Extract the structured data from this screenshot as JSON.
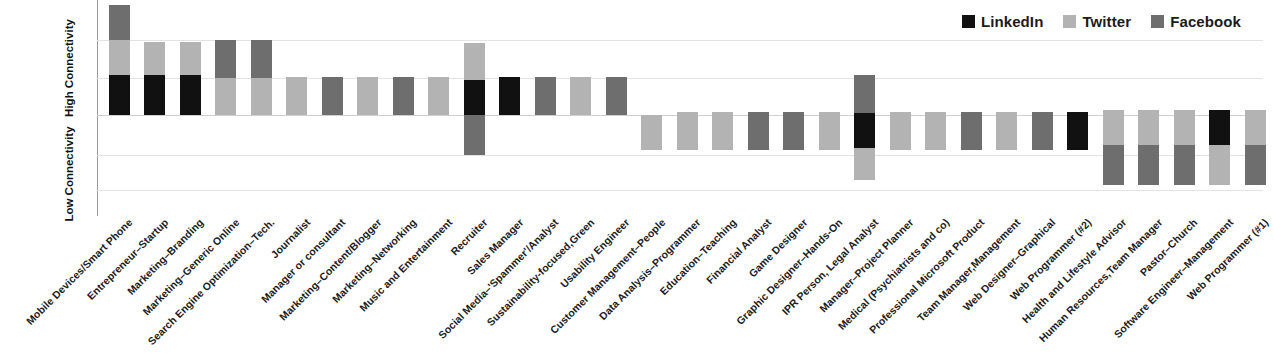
{
  "legend": {
    "position": "top-right",
    "items": [
      {
        "label": "LinkedIn",
        "color": "#111111"
      },
      {
        "label": "Twitter",
        "color": "#b3b3b3"
      },
      {
        "label": "Facebook",
        "color": "#6e6e6e"
      }
    ]
  },
  "yaxis": {
    "high_label": "High Connectivity",
    "low_label": "Low Connectivity"
  },
  "chart_data": {
    "type": "bar",
    "title": "",
    "subtitle": "",
    "xlabel": "",
    "ylabel": "Connectivity",
    "stacked": true,
    "orientation": "vertical",
    "grid": true,
    "legend_position": "top-right",
    "baseline": 0,
    "ylim": [
      -3,
      3
    ],
    "ytick_labels": [
      "High Connectivity",
      "Low Connectivity"
    ],
    "series_colors": {
      "LinkedIn": "#111111",
      "Twitter": "#b3b3b3",
      "Facebook": "#6e6e6e"
    },
    "categories": [
      "Mobile Devices/Smart Phone",
      "Entrepreneur–Startup",
      "Marketing–Branding",
      "Marketing–Generic Online",
      "Search Engine Optimization–Tech.",
      "Journalist",
      "Manager or consultant",
      "Marketing–Content/Blogger",
      "Marketing–Networking",
      "Music and Entertainment",
      "Recruiter",
      "Sales Manager",
      "Social Media–'Spammer'/Analyst",
      "Sustainability-focused,Green",
      "Usability Engineer",
      "Customer Management–People",
      "Data Analysis–Programmer",
      "Education–Teaching",
      "Financial Analyst",
      "Game Designer",
      "Graphic Designer–Hands-On",
      "IPR Person, Legal Analyst",
      "Manager–Project Planner",
      "Medical (Psychiatrists and co)",
      "Professional Microsoft Product",
      "Team Manager,Management",
      "Web Designer–Graphical",
      "Web Programmer (#2)",
      "Health and Lifestyle Advisor",
      "Human Resources,Team Manager",
      "Pastor–Church",
      "Software Engineer–Management",
      "Web Programmer (#1)"
    ],
    "series": [
      {
        "name": "LinkedIn",
        "values": [
          1.0,
          1.0,
          1.0,
          0,
          0,
          0,
          0,
          0,
          0,
          0,
          1.0,
          1.0,
          0,
          0,
          0,
          0,
          0,
          0,
          0,
          0,
          0,
          1.0,
          0,
          0,
          0,
          0,
          0,
          1.0,
          0,
          0,
          0,
          1.0,
          0
        ]
      },
      {
        "name": "Twitter",
        "values": [
          1.0,
          1.0,
          1.0,
          1.0,
          1.0,
          1.0,
          0,
          1.0,
          0,
          1.0,
          1.0,
          0,
          0,
          1.0,
          1.0,
          1.0,
          1.0,
          1.0,
          0,
          0,
          1.0,
          -1.0,
          1.0,
          1.0,
          0,
          1.0,
          0,
          1.0,
          1.0,
          1.0,
          1.0,
          1.0,
          1.0
        ]
      },
      {
        "name": "Facebook",
        "values": [
          1.0,
          0,
          0,
          1.0,
          1.0,
          0,
          1.0,
          0,
          1.0,
          0,
          -1.0,
          0,
          1.0,
          0,
          0,
          0,
          0,
          0,
          1.0,
          1.0,
          0,
          1.0,
          0,
          0,
          1.0,
          0,
          1.0,
          0,
          -1.0,
          -1.0,
          -1.0,
          0,
          -1.0
        ]
      }
    ],
    "bars": [
      {
        "category": "Mobile Devices/Smart Phone",
        "segments": [
          {
            "series": "Facebook",
            "top": 5,
            "bottom": 40
          },
          {
            "series": "Twitter",
            "top": 40,
            "bottom": 75
          },
          {
            "series": "LinkedIn",
            "top": 75,
            "bottom": 115
          }
        ]
      },
      {
        "category": "Entrepreneur–Startup",
        "segments": [
          {
            "series": "Twitter",
            "top": 42,
            "bottom": 75
          },
          {
            "series": "LinkedIn",
            "top": 75,
            "bottom": 115
          }
        ]
      },
      {
        "category": "Marketing–Branding",
        "segments": [
          {
            "series": "Twitter",
            "top": 42,
            "bottom": 75
          },
          {
            "series": "LinkedIn",
            "top": 75,
            "bottom": 115
          }
        ]
      },
      {
        "category": "Marketing–Generic Online",
        "segments": [
          {
            "series": "Facebook",
            "top": 40,
            "bottom": 78
          },
          {
            "series": "Twitter",
            "top": 78,
            "bottom": 115
          }
        ]
      },
      {
        "category": "Search Engine Optimization–Tech.",
        "segments": [
          {
            "series": "Facebook",
            "top": 40,
            "bottom": 78
          },
          {
            "series": "Twitter",
            "top": 78,
            "bottom": 115
          }
        ]
      },
      {
        "category": "Journalist",
        "segments": [
          {
            "series": "Twitter",
            "top": 77,
            "bottom": 115
          }
        ]
      },
      {
        "category": "Manager or consultant",
        "segments": [
          {
            "series": "Facebook",
            "top": 77,
            "bottom": 115
          }
        ]
      },
      {
        "category": "Marketing–Content/Blogger",
        "segments": [
          {
            "series": "Twitter",
            "top": 77,
            "bottom": 115
          }
        ]
      },
      {
        "category": "Marketing–Networking",
        "segments": [
          {
            "series": "Facebook",
            "top": 77,
            "bottom": 115
          }
        ]
      },
      {
        "category": "Music and Entertainment",
        "segments": [
          {
            "series": "Twitter",
            "top": 77,
            "bottom": 115
          }
        ]
      },
      {
        "category": "Recruiter",
        "segments": [
          {
            "series": "Twitter",
            "top": 43,
            "bottom": 80
          },
          {
            "series": "LinkedIn",
            "top": 80,
            "bottom": 115
          },
          {
            "series": "Facebook",
            "top": 115,
            "bottom": 155
          }
        ]
      },
      {
        "category": "Sales Manager",
        "segments": [
          {
            "series": "LinkedIn",
            "top": 77,
            "bottom": 115
          }
        ]
      },
      {
        "category": "Social Media–'Spammer'/Analyst",
        "segments": [
          {
            "series": "Facebook",
            "top": 77,
            "bottom": 115
          }
        ]
      },
      {
        "category": "Sustainability-focused,Green",
        "segments": [
          {
            "series": "Twitter",
            "top": 77,
            "bottom": 115
          }
        ]
      },
      {
        "category": "Usability Engineer",
        "segments": [
          {
            "series": "Facebook",
            "top": 77,
            "bottom": 115
          }
        ]
      },
      {
        "category": "Customer Management–People",
        "segments": [
          {
            "series": "Twitter",
            "top": 115,
            "bottom": 150
          }
        ]
      },
      {
        "category": "Data Analysis–Programmer",
        "segments": [
          {
            "series": "Twitter",
            "top": 112,
            "bottom": 150
          }
        ]
      },
      {
        "category": "Education–Teaching",
        "segments": [
          {
            "series": "Twitter",
            "top": 112,
            "bottom": 150
          }
        ]
      },
      {
        "category": "Financial Analyst",
        "segments": [
          {
            "series": "Facebook",
            "top": 112,
            "bottom": 150
          }
        ]
      },
      {
        "category": "Game Designer",
        "segments": [
          {
            "series": "Facebook",
            "top": 112,
            "bottom": 150
          }
        ]
      },
      {
        "category": "Graphic Designer–Hands-On",
        "segments": [
          {
            "series": "Twitter",
            "top": 112,
            "bottom": 150
          }
        ]
      },
      {
        "category": "IPR Person, Legal Analyst",
        "segments": [
          {
            "series": "Facebook",
            "top": 75,
            "bottom": 113
          },
          {
            "series": "LinkedIn",
            "top": 113,
            "bottom": 148
          },
          {
            "series": "Twitter",
            "top": 148,
            "bottom": 180
          }
        ]
      },
      {
        "category": "Manager–Project Planner",
        "segments": [
          {
            "series": "Twitter",
            "top": 112,
            "bottom": 150
          }
        ]
      },
      {
        "category": "Medical (Psychiatrists and co)",
        "segments": [
          {
            "series": "Twitter",
            "top": 112,
            "bottom": 150
          }
        ]
      },
      {
        "category": "Professional Microsoft Product",
        "segments": [
          {
            "series": "Facebook",
            "top": 112,
            "bottom": 150
          }
        ]
      },
      {
        "category": "Team Manager,Management",
        "segments": [
          {
            "series": "Twitter",
            "top": 112,
            "bottom": 150
          }
        ]
      },
      {
        "category": "Web Designer–Graphical",
        "segments": [
          {
            "series": "Facebook",
            "top": 112,
            "bottom": 150
          }
        ]
      },
      {
        "category": "Web Programmer (#2)",
        "segments": [
          {
            "series": "LinkedIn",
            "top": 112,
            "bottom": 150
          }
        ]
      },
      {
        "category": "Health and Lifestyle Advisor",
        "segments": [
          {
            "series": "Twitter",
            "top": 110,
            "bottom": 145
          },
          {
            "series": "Facebook",
            "top": 145,
            "bottom": 185
          }
        ]
      },
      {
        "category": "Human Resources,Team Manager",
        "segments": [
          {
            "series": "Twitter",
            "top": 110,
            "bottom": 145
          },
          {
            "series": "Facebook",
            "top": 145,
            "bottom": 185
          }
        ]
      },
      {
        "category": "Pastor–Church",
        "segments": [
          {
            "series": "Twitter",
            "top": 110,
            "bottom": 145
          },
          {
            "series": "Facebook",
            "top": 145,
            "bottom": 185
          }
        ]
      },
      {
        "category": "Software Engineer–Management",
        "segments": [
          {
            "series": "LinkedIn",
            "top": 110,
            "bottom": 145
          },
          {
            "series": "Twitter",
            "top": 145,
            "bottom": 185
          }
        ]
      },
      {
        "category": "Web Programmer (#1)",
        "segments": [
          {
            "series": "Twitter",
            "top": 110,
            "bottom": 145
          },
          {
            "series": "Facebook",
            "top": 145,
            "bottom": 185
          }
        ]
      }
    ],
    "layout": {
      "plot_left": 97,
      "plot_width": 1166,
      "plot_height": 216,
      "baseline_y": 115,
      "gridlines_y": [
        40,
        78,
        155,
        190
      ],
      "bar_width": 21,
      "first_bar_center": 22,
      "bar_pitch": 35.5
    }
  }
}
